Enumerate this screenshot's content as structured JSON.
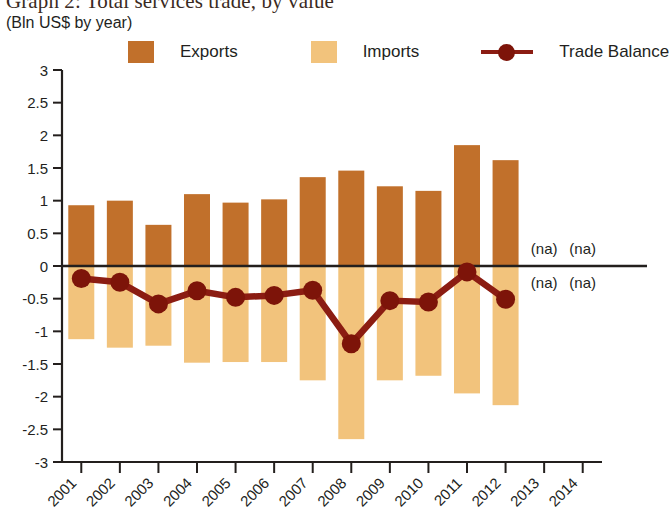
{
  "title": "Graph 2: Total services trade, by value",
  "subtitle": "(Bln US$ by year)",
  "colors": {
    "exports": "#C1702B",
    "imports": "#F2C37C",
    "trade_balance": "#8B1C12",
    "marker": "#7D1409",
    "axis": "#231f1d"
  },
  "legend": {
    "position": "top",
    "items": [
      {
        "label": "Exports",
        "type": "swatch",
        "color": "#C1702B"
      },
      {
        "label": "Imports",
        "type": "swatch",
        "color": "#F2C37C"
      },
      {
        "label": "Trade Balance",
        "type": "line-marker",
        "color": "#8B1C12"
      }
    ]
  },
  "annotations": {
    "na_text": "(na)",
    "na_cells": [
      {
        "year": "2013",
        "band": "above-zero"
      },
      {
        "year": "2014",
        "band": "above-zero"
      },
      {
        "year": "2013",
        "band": "below-zero"
      },
      {
        "year": "2014",
        "band": "below-zero"
      }
    ]
  },
  "chart_data": {
    "type": "bar",
    "title": "Graph 2: Total services trade, by value",
    "subtitle": "(Bln US$ by year)",
    "xlabel": "",
    "ylabel": "",
    "ylim": [
      -3,
      3
    ],
    "ytick_step": 0.5,
    "yticks": [
      "3",
      "2.5",
      "2",
      "1.5",
      "1",
      "0.5",
      "0",
      "-0.5",
      "-1",
      "-1.5",
      "-2",
      "-2.5",
      "-3"
    ],
    "grid": false,
    "legend_position": "top",
    "categories": [
      "2001",
      "2002",
      "2003",
      "2004",
      "2005",
      "2006",
      "2007",
      "2008",
      "2009",
      "2010",
      "2011",
      "2012",
      "2013",
      "2014"
    ],
    "series": [
      {
        "name": "Exports",
        "type": "bar",
        "color": "#C1702B",
        "values": [
          0.93,
          1.0,
          0.63,
          1.1,
          0.97,
          1.02,
          1.36,
          1.46,
          1.22,
          1.15,
          1.85,
          1.62,
          null,
          null
        ]
      },
      {
        "name": "Imports",
        "type": "bar",
        "color": "#F2C37C",
        "values": [
          -1.12,
          -1.25,
          -1.22,
          -1.48,
          -1.47,
          -1.47,
          -1.75,
          -2.65,
          -1.75,
          -1.68,
          -1.95,
          -2.13,
          null,
          null
        ]
      },
      {
        "name": "Trade Balance",
        "type": "line",
        "color": "#8B1C12",
        "values": [
          -0.19,
          -0.25,
          -0.58,
          -0.38,
          -0.48,
          -0.45,
          -0.37,
          -1.19,
          -0.53,
          -0.55,
          -0.09,
          -0.51,
          null,
          null
        ]
      }
    ]
  }
}
